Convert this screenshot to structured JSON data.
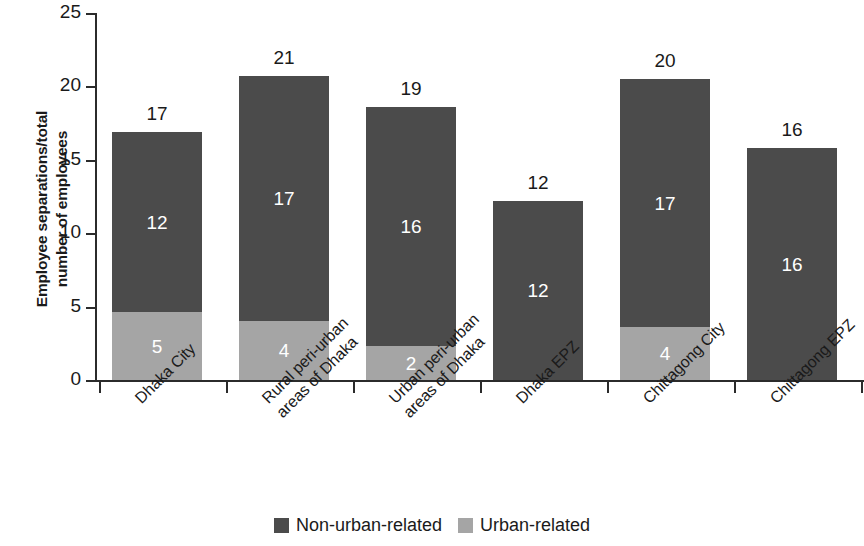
{
  "chart_data": {
    "type": "bar",
    "subtype": "stacked-vertical",
    "title": "",
    "xlabel": "",
    "ylabel": "Employee separations/total number of employees",
    "ylabel_lines": [
      "Employee separations/total",
      "number of employees"
    ],
    "ylim": [
      0,
      25
    ],
    "yticks": [
      0,
      5,
      10,
      15,
      20,
      25
    ],
    "ytick_labels": [
      "0",
      "5",
      "10",
      "15",
      "20",
      "25"
    ],
    "grid": false,
    "legend_position": "bottom-center",
    "categories": [
      "Dhaka City",
      "Rural peri-urban areas of Dhaka",
      "Urban peri-urban areas of Dhaka",
      "Dhaka EPZ",
      "Chittagong City",
      "Chittagong EPZ"
    ],
    "category_label_lines": [
      [
        "Dhaka City"
      ],
      [
        "Rural peri-urban",
        "areas of Dhaka"
      ],
      [
        "Urban peri-urban",
        "areas of Dhaka"
      ],
      [
        "Dhaka EPZ"
      ],
      [
        "Chittagong City"
      ],
      [
        "Chittagong EPZ"
      ]
    ],
    "series": [
      {
        "name": "Urban-related",
        "color": "#a5a5a5",
        "values": [
          4.6,
          4.0,
          2.3,
          0,
          3.6,
          0
        ],
        "labels": [
          "5",
          "4",
          "2",
          "",
          "4",
          ""
        ]
      },
      {
        "name": "Non-urban-related",
        "color": "#4b4b4b",
        "values": [
          12.3,
          16.7,
          16.3,
          12.2,
          16.9,
          15.8
        ],
        "labels": [
          "12",
          "17",
          "16",
          "12",
          "17",
          "16"
        ]
      }
    ],
    "stack_order": [
      "Urban-related",
      "Non-urban-related"
    ],
    "totals": [
      16.9,
      20.7,
      18.6,
      12.2,
      20.5,
      15.8
    ],
    "total_labels": [
      "17",
      "21",
      "19",
      "12",
      "20",
      "16"
    ]
  },
  "legend": {
    "items": [
      {
        "label": "Non-urban-related",
        "color": "#4b4b4b"
      },
      {
        "label": "Urban-related",
        "color": "#a5a5a5"
      }
    ]
  },
  "colors": {
    "dark": "#4b4b4b",
    "light": "#a5a5a5",
    "axis": "#2b2b2b",
    "text": "#1a1a1a",
    "background": "#ffffff",
    "value_label_on_bar": "#ffffff"
  }
}
